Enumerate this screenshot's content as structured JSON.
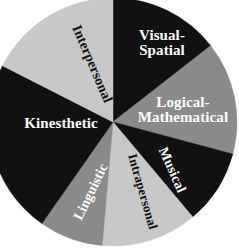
{
  "chart_data": {
    "type": "pie",
    "title": "",
    "subtitle": "",
    "xlabel": "",
    "ylabel": "",
    "legend_position": "none",
    "grid": false,
    "labels_inside_slices": true,
    "total_degrees": 360,
    "start_angle_deg": 0,
    "direction": "clockwise",
    "categories": [
      "Visual-Spatial",
      "Logical-Mathematical",
      "Musical",
      "Intrapersonal",
      "Linguistic",
      "Kinesthetic",
      "Interpersonal"
    ],
    "values": [
      52,
      53,
      35,
      45,
      30,
      82,
      63
    ],
    "slices": [
      {
        "label": "Visual-Spatial",
        "label_line_1": "Visual-",
        "label_line_2": "Spatial",
        "start_deg": 0,
        "end_deg": 52,
        "sweep_deg": 52,
        "fill": "#111111",
        "text_color": "#ffffff",
        "fill_name": "black"
      },
      {
        "label": "Logical-Mathematical",
        "label_line_1": "Logical-",
        "label_line_2": "Mathematical",
        "start_deg": 52,
        "end_deg": 105,
        "sweep_deg": 53,
        "fill": "#8a8a8a",
        "text_color": "#ffffff",
        "fill_name": "medium-gray"
      },
      {
        "label": "Musical",
        "label_line_1": "Musical",
        "label_line_2": "",
        "start_deg": 105,
        "end_deg": 140,
        "sweep_deg": 35,
        "fill": "#111111",
        "text_color": "#ffffff",
        "fill_name": "black"
      },
      {
        "label": "Intrapersonal",
        "label_line_1": "Intrapersonal",
        "label_line_2": "",
        "start_deg": 140,
        "end_deg": 185,
        "sweep_deg": 45,
        "fill": "#c8c8c8",
        "text_color": "#111111",
        "fill_name": "light-gray"
      },
      {
        "label": "Linguistic",
        "label_line_1": "Linguistic",
        "label_line_2": "",
        "start_deg": 185,
        "end_deg": 215,
        "sweep_deg": 30,
        "fill": "#8a8a8a",
        "text_color": "#ffffff",
        "fill_name": "medium-gray"
      },
      {
        "label": "Kinesthetic",
        "label_line_1": "Kinesthetic",
        "label_line_2": "",
        "start_deg": 215,
        "end_deg": 297,
        "sweep_deg": 82,
        "fill": "#111111",
        "text_color": "#ffffff",
        "fill_name": "black"
      },
      {
        "label": "Interpersonal",
        "label_line_1": "Interpersonal",
        "label_line_2": "",
        "start_deg": 297,
        "end_deg": 360,
        "sweep_deg": 63,
        "fill": "#c8c8c8",
        "text_color": "#111111",
        "fill_name": "light-gray"
      }
    ],
    "colors": {
      "black": "#111111",
      "medium_gray": "#8a8a8a",
      "light_gray": "#c8c8c8",
      "background": "#ffffff"
    },
    "geometry": {
      "center_x": 113,
      "center_y": 122,
      "radius": 124
    }
  }
}
